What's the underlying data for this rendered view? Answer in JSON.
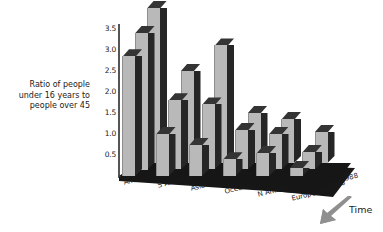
{
  "chart_data": {
    "type": "bar",
    "title": "",
    "subtitle": "",
    "xlabel": "",
    "ylabel": "Ratio of people under 16 years to people over 45",
    "zlabel": "Time",
    "ylim": [
      0,
      3.75
    ],
    "grid": false,
    "legend": "none",
    "projection": "3d",
    "categories": [
      "Africa",
      "S America",
      "Asia",
      "Oceania",
      "N America",
      "Europe"
    ],
    "series": [
      {
        "name": "1988",
        "values": [
          3.7,
          2.2,
          2.8,
          1.2,
          1.05,
          0.75
        ]
      },
      {
        "name": "1998",
        "values": [
          3.25,
          1.65,
          1.55,
          0.95,
          0.85,
          0.42
        ]
      },
      {
        "name": "2008",
        "values": [
          2.85,
          1.0,
          0.75,
          0.4,
          0.55,
          0.2
        ]
      }
    ],
    "y_ticks": [
      "0.5",
      "1.0",
      "1.5",
      "2.0",
      "2.5",
      "3.0",
      "3.5"
    ],
    "y_tick_values": [
      0.5,
      1.0,
      1.5,
      2.0,
      2.5,
      3.0,
      3.5
    ],
    "time_ticks": [
      "1988",
      "1998",
      "2008"
    ],
    "annotations": [
      "Time"
    ],
    "colors": {
      "bar_front": "#b9b9b9",
      "bar_side": "#262626",
      "bar_top": "#343434",
      "floor": "#161616",
      "axis": "#555555",
      "text": "#1a1a1a",
      "background": "#ffffff",
      "arrow": "#8a8a8a"
    }
  },
  "axis": {
    "y_title_line1": "Ratio of people",
    "y_title_line2": "under 16 years to",
    "y_title_line3": "people over 45",
    "time_title": "Time"
  }
}
